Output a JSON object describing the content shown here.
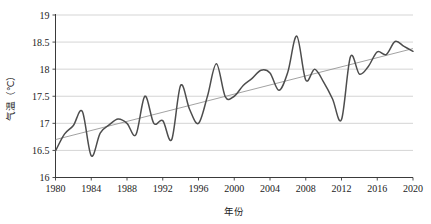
{
  "chart_data": {
    "type": "line",
    "title": "",
    "xlabel": "年份",
    "ylabel": "气温（℃）",
    "xlim": [
      1980,
      2020
    ],
    "ylim": [
      16,
      19
    ],
    "grid": true,
    "legend": "none",
    "xticks": [
      "1980",
      "1984",
      "1988",
      "1992",
      "1996",
      "2000",
      "2004",
      "2008",
      "2012",
      "2016",
      "2020"
    ],
    "yticks": [
      "16",
      "16.5",
      "17",
      "17.5",
      "18",
      "18.5",
      "19"
    ],
    "x": [
      1980,
      1981,
      1982,
      1983,
      1984,
      1985,
      1986,
      1987,
      1988,
      1989,
      1990,
      1991,
      1992,
      1993,
      1994,
      1995,
      1996,
      1997,
      1998,
      1999,
      2000,
      2001,
      2002,
      2003,
      2004,
      2005,
      2006,
      2007,
      2008,
      2009,
      2010,
      2011,
      2012,
      2013,
      2014,
      2015,
      2016,
      2017,
      2018,
      2019,
      2020
    ],
    "series": [
      {
        "name": "年平均气温",
        "color": "#4d4d4d",
        "values": [
          16.49,
          16.8,
          16.96,
          17.22,
          16.4,
          16.82,
          16.97,
          17.08,
          17.0,
          16.79,
          17.5,
          17.0,
          17.05,
          16.7,
          17.7,
          17.26,
          17.0,
          17.5,
          18.1,
          17.49,
          17.5,
          17.7,
          17.83,
          17.98,
          17.93,
          17.61,
          17.95,
          18.61,
          17.8,
          18.0,
          17.76,
          17.45,
          17.07,
          18.23,
          17.91,
          18.05,
          18.32,
          18.27,
          18.51,
          18.42,
          18.33
        ]
      }
    ],
    "trend": {
      "name": "线性趋势",
      "color": "#8a8a8a",
      "start_value": 16.7,
      "end_value": 18.38
    }
  },
  "axes": {
    "y_axis_label": "气温（℃）",
    "x_axis_label": "年份"
  }
}
